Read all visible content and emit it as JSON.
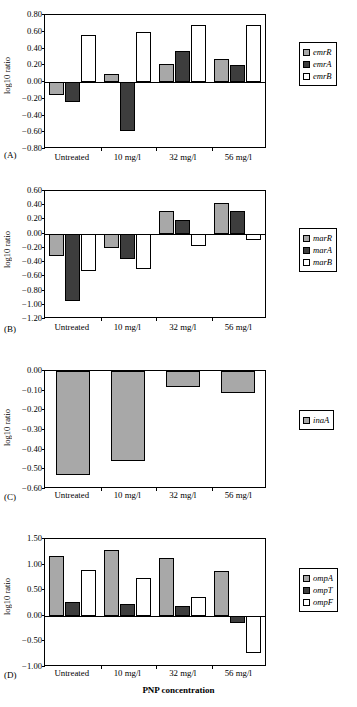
{
  "figure": {
    "xaxis_title": "PNP concentration",
    "yaxis_label": "log10 ratio",
    "categories": [
      "Untreated",
      "10 mg/l",
      "32 mg/l",
      "56 mg/l"
    ],
    "colors": {
      "light_gray": "#a8a8a8",
      "dark_gray": "#3d3d3d",
      "white": "#ffffff",
      "axis": "#000000"
    }
  },
  "panels": [
    {
      "letter": "(A)",
      "ylabel": "log10 ratio",
      "yticks": [
        "0.80",
        "0.60",
        "0.40",
        "0.20",
        "0.00",
        "−0.20",
        "−0.40",
        "−0.60",
        "−0.80"
      ],
      "legend": [
        "emrR",
        "emrA",
        "emrB"
      ]
    },
    {
      "letter": "(B)",
      "ylabel": "log10 ratio",
      "yticks": [
        "0.60",
        "0.40",
        "0.20",
        "0.00",
        "−0.20",
        "−0.40",
        "−0.60",
        "−0.80",
        "−1.00",
        "−1.20"
      ],
      "legend": [
        "marR",
        "marA",
        "marB"
      ]
    },
    {
      "letter": "(C)",
      "ylabel": "log10 ratio",
      "yticks": [
        "0.00",
        "−0.10",
        "−0.20",
        "−0.30",
        "−0.40",
        "−0.50",
        "−0.60"
      ],
      "legend": [
        "inaA"
      ]
    },
    {
      "letter": "(D)",
      "ylabel": "log10 ratio",
      "yticks": [
        "1.50",
        "1.00",
        "0.50",
        "0.00",
        "−0.50",
        "−1.00"
      ],
      "legend": [
        "ompA",
        "ompT",
        "ompF"
      ]
    }
  ],
  "chart_data": [
    {
      "type": "bar",
      "panel": "A",
      "title": "",
      "xlabel": "PNP concentration",
      "ylabel": "log10 ratio",
      "ylim": [
        -0.8,
        0.8
      ],
      "ytick_step": 0.2,
      "grid": false,
      "legend_position": "right",
      "categories": [
        "Untreated",
        "10 mg/l",
        "32 mg/l",
        "56 mg/l"
      ],
      "series": [
        {
          "name": "emrR",
          "fill": "#a8a8a8",
          "values": [
            -0.16,
            0.09,
            0.21,
            0.28
          ]
        },
        {
          "name": "emrA",
          "fill": "#3d3d3d",
          "values": [
            -0.24,
            -0.58,
            0.37,
            0.2
          ]
        },
        {
          "name": "emrB",
          "fill": "#ffffff",
          "values": [
            0.56,
            0.6,
            0.68,
            0.68
          ]
        }
      ]
    },
    {
      "type": "bar",
      "panel": "B",
      "title": "",
      "xlabel": "PNP concentration",
      "ylabel": "log10 ratio",
      "ylim": [
        -1.2,
        0.6
      ],
      "ytick_step": 0.2,
      "grid": false,
      "legend_position": "right",
      "categories": [
        "Untreated",
        "10 mg/l",
        "32 mg/l",
        "56 mg/l"
      ],
      "series": [
        {
          "name": "marR",
          "fill": "#a8a8a8",
          "values": [
            -0.31,
            -0.2,
            0.32,
            0.43
          ]
        },
        {
          "name": "marA",
          "fill": "#3d3d3d",
          "values": [
            -0.95,
            -0.36,
            0.19,
            0.32
          ]
        },
        {
          "name": "marB",
          "fill": "#ffffff",
          "values": [
            -0.53,
            -0.5,
            -0.17,
            -0.09
          ]
        }
      ]
    },
    {
      "type": "bar",
      "panel": "C",
      "title": "",
      "xlabel": "PNP concentration",
      "ylabel": "log10 ratio",
      "ylim": [
        -0.6,
        0.0
      ],
      "ytick_step": 0.1,
      "grid": false,
      "legend_position": "right",
      "categories": [
        "Untreated",
        "10 mg/l",
        "32 mg/l",
        "56 mg/l"
      ],
      "series": [
        {
          "name": "inaA",
          "fill": "#a8a8a8",
          "values": [
            -0.53,
            -0.46,
            -0.08,
            -0.11
          ]
        }
      ]
    },
    {
      "type": "bar",
      "panel": "D",
      "title": "",
      "xlabel": "PNP concentration",
      "ylabel": "log10 ratio",
      "ylim": [
        -1.0,
        1.5
      ],
      "ytick_step": 0.5,
      "grid": false,
      "legend_position": "right",
      "categories": [
        "Untreated",
        "10 mg/l",
        "32 mg/l",
        "56 mg/l"
      ],
      "series": [
        {
          "name": "ompA",
          "fill": "#a8a8a8",
          "values": [
            1.17,
            1.28,
            1.13,
            0.88
          ]
        },
        {
          "name": "ompT",
          "fill": "#3d3d3d",
          "values": [
            0.27,
            0.23,
            0.19,
            -0.14
          ]
        },
        {
          "name": "ompF",
          "fill": "#ffffff",
          "values": [
            0.89,
            0.74,
            0.37,
            -0.72
          ]
        }
      ]
    }
  ]
}
